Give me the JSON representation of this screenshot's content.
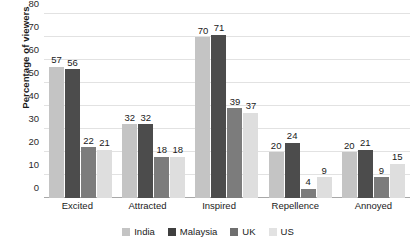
{
  "chart_data": {
    "type": "bar",
    "title": "",
    "xlabel": "",
    "ylabel": "Percentage of viewers",
    "ylim": [
      0,
      80
    ],
    "ytick_step": 10,
    "yticks": [
      80,
      70,
      60,
      50,
      40,
      30,
      20,
      10,
      0
    ],
    "grid": true,
    "legend_position": "bottom-center",
    "categories": [
      "Excited",
      "Attracted",
      "Inspired",
      "Repellence",
      "Annoyed"
    ],
    "series": [
      {
        "name": "India",
        "color": "#c4c4c4",
        "values": [
          57,
          32,
          70,
          20,
          20
        ]
      },
      {
        "name": "Malaysia",
        "color": "#4c4c4c",
        "values": [
          56,
          32,
          71,
          24,
          21
        ]
      },
      {
        "name": "UK",
        "color": "#7c7c7c",
        "values": [
          22,
          18,
          39,
          4,
          9
        ]
      },
      {
        "name": "US",
        "color": "#dedede",
        "values": [
          21,
          18,
          37,
          9,
          15
        ]
      }
    ],
    "data_labels": true
  }
}
